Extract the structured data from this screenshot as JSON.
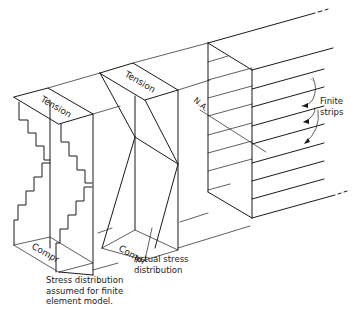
{
  "figure": {
    "blocks": [
      {
        "name": "finite-element-model-stress-block",
        "top_label": "Tension",
        "bottom_label": "Compr",
        "caption": "Stress distribution\nassumed for finite\nelement model."
      },
      {
        "name": "actual-stress-block",
        "top_label": "Tension",
        "bottom_label": "Compr",
        "caption": "Actual stress\ndistribution"
      },
      {
        "name": "beam-section",
        "neutral_axis_label": "N.A.",
        "strips_label": "Finite\nstrips"
      }
    ],
    "line_color": "#1a1a1a",
    "background": "#ffffff"
  }
}
